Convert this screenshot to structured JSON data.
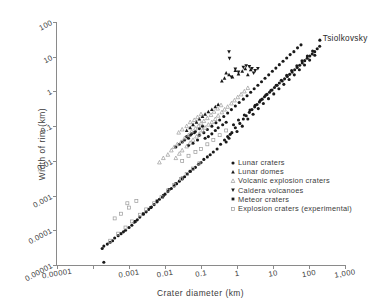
{
  "chart_data": {
    "type": "scatter",
    "title": "",
    "xlabel": "Crater diameter (km)",
    "ylabel": "Width of rim (km)",
    "xscale": "log",
    "yscale": "log",
    "xlim": [
      1e-05,
      1000
    ],
    "ylim": [
      1e-05,
      100
    ],
    "grid": false,
    "legend_position": "inside lower-right",
    "background_color": "#ffffff",
    "axis_color": "#8a8a8a",
    "marker_color": "#1a1a1a",
    "open_marker_color": "#9a9a9a",
    "xticks": [
      1e-05,
      0.0001,
      0.001,
      0.01,
      0.1,
      1,
      10,
      100,
      1000
    ],
    "xtick_labels": [
      "0.00001",
      "",
      "0.001",
      "0.01",
      "0.1",
      "1",
      "10",
      "100",
      "1,000"
    ],
    "yticks": [
      1e-05,
      0.0001,
      0.001,
      0.01,
      0.1,
      1,
      10,
      100
    ],
    "ytick_labels": [
      "0.00001",
      "0.0001",
      "0.001",
      "0.01",
      "0.1",
      "1",
      "10",
      "100"
    ],
    "annotations": [
      {
        "text": "Tsiolkovsky",
        "x": 200,
        "y": 30
      }
    ],
    "series": [
      {
        "name": "Lunar craters",
        "marker": "filled-circle",
        "color": "#1a1a1a",
        "points": [
          [
            0.9,
            0.09
          ],
          [
            1.2,
            0.12
          ],
          [
            1.5,
            0.16
          ],
          [
            1.8,
            0.2
          ],
          [
            2.2,
            0.25
          ],
          [
            2.6,
            0.3
          ],
          [
            3.1,
            0.36
          ],
          [
            3.6,
            0.42
          ],
          [
            4.2,
            0.5
          ],
          [
            5.0,
            0.6
          ],
          [
            5.8,
            0.7
          ],
          [
            6.8,
            0.82
          ],
          [
            8.0,
            0.95
          ],
          [
            9.4,
            1.1
          ],
          [
            11,
            1.3
          ],
          [
            13,
            1.5
          ],
          [
            15,
            1.75
          ],
          [
            18,
            2.0
          ],
          [
            21,
            2.3
          ],
          [
            25,
            2.7
          ],
          [
            29,
            3.1
          ],
          [
            34,
            3.6
          ],
          [
            40,
            4.2
          ],
          [
            47,
            4.9
          ],
          [
            55,
            5.7
          ],
          [
            65,
            6.6
          ],
          [
            76,
            7.7
          ],
          [
            89,
            9.0
          ],
          [
            105,
            10.5
          ],
          [
            123,
            12
          ],
          [
            144,
            14
          ],
          [
            169,
            17
          ],
          [
            198,
            20
          ],
          [
            1.0,
            0.07
          ],
          [
            1.4,
            0.1
          ],
          [
            2.0,
            0.16
          ],
          [
            2.8,
            0.22
          ],
          [
            3.9,
            0.32
          ],
          [
            5.4,
            0.45
          ],
          [
            7.5,
            0.62
          ],
          [
            10.5,
            0.85
          ],
          [
            14.6,
            1.2
          ],
          [
            20,
            1.6
          ],
          [
            28,
            2.2
          ],
          [
            39,
            3.0
          ],
          [
            54,
            4.2
          ],
          [
            75,
            5.8
          ],
          [
            104,
            8.0
          ],
          [
            145,
            11
          ],
          [
            0.8,
            0.11
          ],
          [
            1.1,
            0.15
          ],
          [
            1.6,
            0.21
          ],
          [
            2.3,
            0.29
          ],
          [
            3.2,
            0.4
          ],
          [
            4.5,
            0.56
          ],
          [
            6.3,
            0.78
          ],
          [
            8.8,
            1.08
          ],
          [
            12.3,
            1.5
          ],
          [
            17,
            2.1
          ],
          [
            24,
            2.9
          ],
          [
            33,
            4.0
          ],
          [
            46,
            5.5
          ],
          [
            64,
            7.6
          ],
          [
            90,
            10.5
          ],
          [
            126,
            14.5
          ],
          [
            0.35,
            0.03
          ],
          [
            0.45,
            0.04
          ],
          [
            0.55,
            0.05
          ],
          [
            0.65,
            0.058
          ],
          [
            0.72,
            0.065
          ],
          [
            0.5,
            0.035
          ],
          [
            0.6,
            0.045
          ],
          [
            0.28,
            0.022
          ],
          [
            0.22,
            0.018
          ],
          [
            0.18,
            0.015
          ],
          [
            0.15,
            0.013
          ],
          [
            0.12,
            0.011
          ],
          [
            0.1,
            0.009
          ],
          [
            0.085,
            0.008
          ],
          [
            0.07,
            0.0065
          ],
          [
            0.06,
            0.0058
          ],
          [
            0.05,
            0.005
          ],
          [
            0.042,
            0.0042
          ],
          [
            0.035,
            0.0035
          ],
          [
            0.03,
            0.003
          ],
          [
            0.025,
            0.0026
          ],
          [
            0.021,
            0.0022
          ],
          [
            0.018,
            0.0019
          ],
          [
            0.015,
            0.0016
          ],
          [
            0.012,
            0.0013
          ],
          [
            0.01,
            0.0011
          ],
          [
            0.0085,
            0.0009
          ],
          [
            0.007,
            0.00078
          ],
          [
            0.006,
            0.00066
          ],
          [
            0.005,
            0.00055
          ],
          [
            0.0042,
            0.00047
          ],
          [
            0.0035,
            0.0004
          ],
          [
            0.003,
            0.00034
          ],
          [
            0.0025,
            0.00029
          ],
          [
            0.002,
            0.00024
          ],
          [
            0.0017,
            0.0002
          ],
          [
            0.0014,
            0.00017
          ],
          [
            0.0012,
            0.00014
          ],
          [
            0.001,
            0.00012
          ],
          [
            0.0008,
            0.0001
          ],
          [
            0.0007,
            9e-05
          ],
          [
            0.0006,
            8e-05
          ],
          [
            0.0005,
            7e-05
          ],
          [
            0.0004,
            6e-05
          ],
          [
            0.00035,
            5e-05
          ],
          [
            0.0003,
            4.5e-05
          ],
          [
            0.00025,
            4e-05
          ],
          [
            0.0002,
            3.5e-05
          ],
          [
            0.00018,
            3e-05
          ],
          [
            0.0002,
            1.2e-05
          ],
          [
            0.055,
            0.06
          ],
          [
            0.07,
            0.07
          ],
          [
            0.09,
            0.085
          ],
          [
            0.11,
            0.1
          ],
          [
            0.13,
            0.045
          ],
          [
            0.16,
            0.05
          ],
          [
            0.2,
            0.06
          ],
          [
            0.25,
            0.075
          ],
          [
            0.3,
            0.09
          ],
          [
            0.4,
            0.11
          ],
          [
            0.5,
            0.13
          ],
          [
            0.08,
            0.04
          ],
          [
            0.06,
            0.032
          ],
          [
            0.045,
            0.028
          ],
          [
            0.09,
            0.055
          ],
          [
            0.12,
            0.065
          ],
          [
            0.15,
            0.08
          ],
          [
            0.2,
            0.1
          ],
          [
            0.26,
            0.125
          ],
          [
            0.33,
            0.15
          ],
          [
            0.43,
            0.19
          ],
          [
            0.55,
            0.24
          ],
          [
            0.7,
            0.3
          ],
          [
            0.9,
            0.38
          ],
          [
            1.15,
            0.48
          ],
          [
            1.5,
            0.6
          ],
          [
            1.9,
            0.75
          ],
          [
            2.4,
            0.95
          ],
          [
            3.0,
            1.2
          ],
          [
            3.8,
            1.5
          ],
          [
            4.8,
            1.9
          ],
          [
            6.0,
            2.4
          ],
          [
            7.6,
            3.0
          ],
          [
            9.6,
            3.8
          ],
          [
            12,
            4.7
          ],
          [
            15,
            5.9
          ],
          [
            19,
            7.4
          ],
          [
            24,
            9.2
          ],
          [
            30,
            11.5
          ],
          [
            38,
            14
          ],
          [
            48,
            18
          ],
          [
            60,
            22
          ],
          [
            0.035,
            0.04
          ],
          [
            0.045,
            0.045
          ],
          [
            0.03,
            0.035
          ],
          [
            0.025,
            0.03
          ],
          [
            0.02,
            0.025
          ],
          [
            0.04,
            0.05
          ],
          [
            0.05,
            0.055
          ],
          [
            0.065,
            0.065
          ]
        ]
      },
      {
        "name": "Lunar domes",
        "marker": "filled-triangle-up",
        "color": "#1a1a1a",
        "points": [
          [
            0.5,
            3.4
          ],
          [
            0.6,
            3.0
          ],
          [
            0.75,
            2.6
          ],
          [
            0.9,
            4.0
          ],
          [
            1.1,
            3.2
          ],
          [
            1.4,
            3.8
          ],
          [
            1.7,
            4.5
          ],
          [
            2.0,
            3.0
          ],
          [
            2.4,
            4.2
          ],
          [
            0.45,
            2.4
          ],
          [
            0.38,
            2.0
          ],
          [
            0.06,
            0.11
          ],
          [
            0.075,
            0.13
          ],
          [
            0.09,
            0.16
          ],
          [
            0.11,
            0.19
          ],
          [
            0.13,
            0.22
          ],
          [
            0.16,
            0.26
          ],
          [
            0.05,
            0.09
          ],
          [
            0.04,
            0.075
          ],
          [
            0.2,
            0.3
          ],
          [
            0.25,
            0.36
          ],
          [
            0.3,
            0.42
          ]
        ]
      },
      {
        "name": "Volcanic explosion craters",
        "marker": "open-triangle-up",
        "color": "#9a9a9a",
        "points": [
          [
            0.02,
            0.012
          ],
          [
            0.025,
            0.016
          ],
          [
            0.03,
            0.02
          ],
          [
            0.04,
            0.026
          ],
          [
            0.05,
            0.033
          ],
          [
            0.06,
            0.04
          ],
          [
            0.075,
            0.05
          ],
          [
            0.09,
            0.06
          ],
          [
            0.11,
            0.075
          ],
          [
            0.13,
            0.09
          ],
          [
            0.16,
            0.11
          ],
          [
            0.2,
            0.13
          ],
          [
            0.25,
            0.16
          ],
          [
            0.3,
            0.2
          ],
          [
            0.38,
            0.25
          ],
          [
            0.45,
            0.3
          ],
          [
            0.55,
            0.36
          ],
          [
            0.7,
            0.45
          ],
          [
            0.85,
            0.55
          ],
          [
            1.05,
            0.68
          ],
          [
            1.3,
            0.82
          ],
          [
            1.6,
            1.0
          ],
          [
            2.0,
            1.25
          ],
          [
            0.015,
            0.02
          ],
          [
            0.018,
            0.025
          ],
          [
            0.022,
            0.03
          ],
          [
            0.028,
            0.035
          ],
          [
            0.035,
            0.045
          ],
          [
            0.045,
            0.055
          ],
          [
            0.055,
            0.07
          ],
          [
            0.07,
            0.085
          ],
          [
            0.085,
            0.1
          ],
          [
            0.1,
            0.12
          ],
          [
            0.12,
            0.14
          ],
          [
            0.15,
            0.17
          ],
          [
            0.19,
            0.21
          ],
          [
            0.23,
            0.26
          ],
          [
            0.29,
            0.32
          ],
          [
            0.36,
            0.4
          ],
          [
            0.012,
            0.015
          ],
          [
            0.009,
            0.012
          ],
          [
            0.007,
            0.009
          ],
          [
            0.05,
            0.13
          ],
          [
            0.065,
            0.15
          ],
          [
            0.08,
            0.18
          ],
          [
            0.1,
            0.22
          ],
          [
            0.04,
            0.1
          ],
          [
            0.03,
            0.08
          ],
          [
            0.024,
            0.065
          ]
        ]
      },
      {
        "name": "Caldera volcanoes",
        "marker": "filled-triangle-down",
        "color": "#1a1a1a",
        "points": [
          [
            0.6,
            14
          ],
          [
            0.62,
            9.0
          ],
          [
            1.5,
            5.0
          ],
          [
            1.8,
            5.5
          ],
          [
            2.2,
            5.2
          ],
          [
            2.6,
            4.6
          ],
          [
            0.9,
            4.4
          ],
          [
            1.1,
            3.6
          ],
          [
            3.2,
            4.0
          ],
          [
            3.8,
            4.6
          ],
          [
            0.7,
            2.6
          ],
          [
            2.9,
            3.4
          ]
        ]
      },
      {
        "name": "Meteor craters",
        "marker": "filled-square",
        "color": "#1a1a1a",
        "points": [
          [
            0.0015,
            0.00018
          ],
          [
            0.0025,
            0.0003
          ],
          [
            0.004,
            0.00045
          ],
          [
            0.006,
            0.0007
          ],
          [
            0.009,
            0.001
          ],
          [
            0.013,
            0.0015
          ],
          [
            0.02,
            0.0022
          ],
          [
            0.03,
            0.0032
          ],
          [
            0.05,
            0.005
          ]
        ]
      },
      {
        "name": "Explosion craters (experimental)",
        "marker": "open-square",
        "color": "#9a9a9a",
        "points": [
          [
            0.0003,
            5e-05
          ],
          [
            0.0005,
            8e-05
          ],
          [
            0.0008,
            0.00012
          ],
          [
            0.0012,
            0.00018
          ],
          [
            0.002,
            0.00028
          ],
          [
            0.003,
            0.0004
          ],
          [
            0.005,
            0.0006
          ],
          [
            0.008,
            0.0009
          ],
          [
            0.012,
            0.0014
          ],
          [
            0.018,
            0.002
          ],
          [
            0.028,
            0.003
          ],
          [
            0.04,
            0.0042
          ],
          [
            0.06,
            0.006
          ],
          [
            0.09,
            0.0085
          ],
          [
            0.0004,
            0.00022
          ],
          [
            0.0006,
            0.0003
          ],
          [
            0.001,
            0.00045
          ],
          [
            0.0016,
            0.0007
          ],
          [
            0.0009,
            0.0006
          ],
          [
            0.07,
            0.018
          ],
          [
            0.1,
            0.022
          ],
          [
            0.15,
            0.03
          ],
          [
            0.22,
            0.04
          ],
          [
            0.33,
            0.055
          ],
          [
            0.5,
            0.075
          ],
          [
            0.045,
            0.014
          ],
          [
            0.03,
            0.01
          ]
        ]
      }
    ]
  },
  "legend": {
    "items": [
      {
        "label": "Lunar craters",
        "marker": "filled-circle"
      },
      {
        "label": "Lunar domes",
        "marker": "filled-triangle-up"
      },
      {
        "label": "Volcanic explosion craters",
        "marker": "open-triangle-up"
      },
      {
        "label": "Caldera volcanoes",
        "marker": "filled-triangle-down"
      },
      {
        "label": "Meteor craters",
        "marker": "filled-square"
      },
      {
        "label": "Explosion craters (experimental)",
        "marker": "open-square"
      }
    ]
  }
}
